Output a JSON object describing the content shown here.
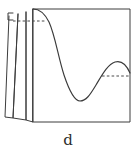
{
  "figure": {
    "panel_label": "d",
    "colors": {
      "ink": "#3c3c3c",
      "curve_ink": "#3a3a3a",
      "dash_ink": "#4a4a4a",
      "background": "#ffffff"
    },
    "plot_box": {
      "name": "plot-frame",
      "left": 33,
      "top": 9,
      "right": 130,
      "bottom": 122
    },
    "stack_planes": [
      {
        "name": "plane-back",
        "points": "26,12 26,120 33,122 33,9"
      },
      {
        "name": "plane-middle",
        "points": "18,14 13,118 26,120 26,12"
      },
      {
        "name": "plane-front",
        "points": "9,16 5,117 13,118 18,14"
      }
    ],
    "bracket": {
      "name": "left-tick-bracket",
      "path": "M 13,13 L 8,13 L 8,20 L 13,20"
    },
    "curve": {
      "name": "s-shaped-curve",
      "path": "M 33,9 C 38,9 44,12 49,22 C 55,35 58,56 64,75 C 69,90 74,101 80,101 C 86,101 90,95 96,85 C 102,75 108,64 115,62 C 122,60 127,66 130,73",
      "start": [
        33,
        9
      ],
      "minimum": [
        80,
        101
      ],
      "local_maximum": [
        118,
        62
      ],
      "end": [
        130,
        73
      ]
    },
    "dashed_lines": [
      {
        "name": "dashed-upper-left",
        "x1": 13,
        "y1": 21,
        "x2": 46,
        "y2": 21
      },
      {
        "name": "dashed-lower-right",
        "x1": 102,
        "y1": 76,
        "x2": 130,
        "y2": 76
      }
    ]
  },
  "chart_data": {
    "type": "line",
    "title": "",
    "subtitle": "",
    "xlabel": "",
    "ylabel": "",
    "panel": "d",
    "grid": false,
    "legend": null,
    "axis_labels_visible": false,
    "tick_labels": [],
    "xlim": [
      33,
      130
    ],
    "ylim": [
      122,
      9
    ],
    "series": [
      {
        "name": "curve",
        "x": [
          33,
          40,
          49,
          57,
          64,
          72,
          80,
          88,
          96,
          104,
          112,
          118,
          124,
          130
        ],
        "y": [
          9,
          11,
          22,
          45,
          75,
          93,
          101,
          99,
          85,
          72,
          64,
          62,
          65,
          73
        ]
      }
    ],
    "annotations": [
      {
        "name": "dashed-upper-left",
        "type": "horizontal-dashed-reference",
        "y": 21,
        "x_start": 13,
        "x_end": 46
      },
      {
        "name": "dashed-lower-right",
        "type": "horizontal-dashed-reference",
        "y": 76,
        "x_start": 102,
        "x_end": 130
      }
    ]
  }
}
